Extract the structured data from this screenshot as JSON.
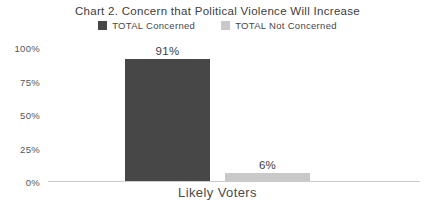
{
  "chart_data": {
    "type": "bar",
    "title": "Chart 2. Concern that Political Violence Will Increase",
    "categories": [
      "Likely Voters"
    ],
    "series": [
      {
        "name": "TOTAL Concerned",
        "values": [
          91
        ],
        "color": "#474747"
      },
      {
        "name": "TOTAL Not Concerned",
        "values": [
          6
        ],
        "color": "#c9c9c9"
      }
    ],
    "value_labels": [
      "91%",
      "6%"
    ],
    "xlabel": "Likely Voters",
    "ylabel": "",
    "ylim": [
      0,
      100
    ],
    "yticks": [
      "100%",
      "75%",
      "50%",
      "25%",
      "0%"
    ],
    "grid": false,
    "legend_position": "top",
    "colors": {
      "concerned_bar": "#474747",
      "not_concerned_bar": "#c9c9c9",
      "axis_line": "#cccccc",
      "text": "#3d3d3d"
    }
  }
}
